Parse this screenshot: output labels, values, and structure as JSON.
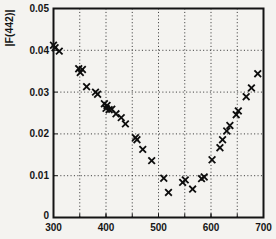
{
  "figure": {
    "ylabel": "|F(442)|",
    "colors": {
      "background": "#f4f3f0",
      "frame": "#141414",
      "grid": "#2e2e2e",
      "marker": "#0d0d0d",
      "text": "#161616"
    }
  },
  "chart_data": {
    "type": "scatter",
    "title": "",
    "xlabel": "",
    "ylabel": "|F(442)|",
    "xlim": [
      300,
      700
    ],
    "ylim": [
      0,
      0.05
    ],
    "x_tick_values": [
      300,
      400,
      500,
      600,
      700
    ],
    "x_tick_labels": [
      "300",
      "400",
      "500",
      "600",
      "700"
    ],
    "y_tick_values": [
      0,
      0.01,
      0.02,
      0.03,
      0.04,
      0.05
    ],
    "y_tick_labels": [
      "0",
      "0.01",
      "0.02",
      "0.03",
      "0.04",
      "0.05"
    ],
    "x_grid_values": [
      350,
      400,
      450,
      500,
      550,
      600,
      650
    ],
    "y_grid_values": [
      0.01,
      0.02,
      0.03,
      0.04
    ],
    "grid_style": "dotted",
    "legend": "none",
    "marker": "x",
    "points": [
      [
        300,
        0.0412
      ],
      [
        303,
        0.0406
      ],
      [
        311,
        0.0398
      ],
      [
        348,
        0.0356
      ],
      [
        351,
        0.0347
      ],
      [
        355,
        0.0354
      ],
      [
        363,
        0.0313
      ],
      [
        380,
        0.03
      ],
      [
        384,
        0.0295
      ],
      [
        397,
        0.0272
      ],
      [
        402,
        0.0268
      ],
      [
        400,
        0.0261
      ],
      [
        406,
        0.0258
      ],
      [
        411,
        0.0259
      ],
      [
        419,
        0.0248
      ],
      [
        429,
        0.0239
      ],
      [
        437,
        0.0224
      ],
      [
        456,
        0.0191
      ],
      [
        459,
        0.0186
      ],
      [
        470,
        0.0163
      ],
      [
        487,
        0.0136
      ],
      [
        510,
        0.0094
      ],
      [
        519,
        0.006
      ],
      [
        546,
        0.0084
      ],
      [
        551,
        0.009
      ],
      [
        565,
        0.0068
      ],
      [
        582,
        0.0093
      ],
      [
        587,
        0.0097
      ],
      [
        602,
        0.0138
      ],
      [
        617,
        0.0167
      ],
      [
        622,
        0.0186
      ],
      [
        630,
        0.0207
      ],
      [
        636,
        0.022
      ],
      [
        648,
        0.0246
      ],
      [
        652,
        0.0255
      ],
      [
        667,
        0.0289
      ],
      [
        677,
        0.031
      ],
      [
        689,
        0.0344
      ]
    ]
  }
}
